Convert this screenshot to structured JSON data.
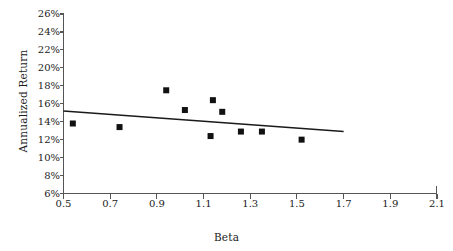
{
  "chart_data": {
    "type": "scatter",
    "title": "",
    "xlabel": "Beta",
    "ylabel": "Annualized Return",
    "xlim": [
      0.5,
      2.1
    ],
    "ylim": [
      6,
      26
    ],
    "xticks": [
      "0.5",
      "0.7",
      "0.9",
      "1.1",
      "1.3",
      "1.5",
      "1.7",
      "1.9",
      "2.1"
    ],
    "xtick_values": [
      0.5,
      0.7,
      0.9,
      1.1,
      1.3,
      1.5,
      1.7,
      1.9,
      2.1
    ],
    "yticks": [
      "6%",
      "8%",
      "10%",
      "12%",
      "14%",
      "16%",
      "18%",
      "20%",
      "22%",
      "24%",
      "26%"
    ],
    "ytick_values": [
      6,
      8,
      10,
      12,
      14,
      16,
      18,
      20,
      22,
      24,
      26
    ],
    "grid": false,
    "legend": "none",
    "marker_color": "#111111",
    "trendline_color": "#1a1a1a",
    "axis_color": "#555555",
    "points": [
      {
        "x": 0.54,
        "y": 13.8
      },
      {
        "x": 0.74,
        "y": 13.4
      },
      {
        "x": 0.94,
        "y": 17.5
      },
      {
        "x": 1.02,
        "y": 15.3
      },
      {
        "x": 1.13,
        "y": 12.4
      },
      {
        "x": 1.14,
        "y": 16.4
      },
      {
        "x": 1.18,
        "y": 15.1
      },
      {
        "x": 1.26,
        "y": 12.9
      },
      {
        "x": 1.35,
        "y": 12.9
      },
      {
        "x": 1.52,
        "y": 12.0
      }
    ],
    "trendline": {
      "x_start": 0.5,
      "y_start": 15.2,
      "x_end": 1.7,
      "y_end": 12.9
    }
  }
}
